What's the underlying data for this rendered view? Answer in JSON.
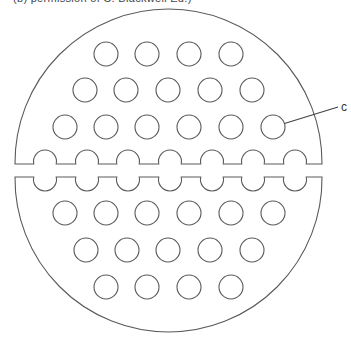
{
  "caption": "(b) permission of C. Blackwell Ed.)",
  "figure": {
    "stroke_color": "#5a5a5a",
    "outer_circle": {
      "cx": 168.5,
      "radius": 153.5,
      "upper_half_cy": 162.5,
      "lower_half_cy": 178.5,
      "upper_cut_y": 164,
      "lower_cut_y": 177
    },
    "hole_radius": 12,
    "upper_rows": [
      {
        "y": 54,
        "xs": [
          106,
          147,
          189,
          231
        ]
      },
      {
        "y": 90,
        "xs": [
          85,
          126,
          168,
          210,
          252
        ]
      },
      {
        "y": 127,
        "xs": [
          65,
          106,
          147,
          189,
          231,
          273
        ]
      }
    ],
    "split_notches": {
      "xs": [
        45,
        87,
        128,
        170,
        212,
        253,
        295
      ],
      "radius": 11.5,
      "upper_cy": 161.5,
      "lower_cy": 179.5
    },
    "lower_rows": [
      {
        "y": 213,
        "xs": [
          65,
          106,
          147,
          189,
          231,
          273
        ]
      },
      {
        "y": 250,
        "xs": [
          86,
          127,
          168,
          210,
          252
        ]
      },
      {
        "y": 287,
        "xs": [
          106,
          147,
          189,
          231
        ]
      }
    ],
    "callout": {
      "label": "c",
      "target_hole": {
        "x": 273,
        "y": 127
      },
      "line_end": {
        "x": 338,
        "y": 107
      },
      "label_pos": {
        "x": 341,
        "y": 111
      }
    }
  }
}
